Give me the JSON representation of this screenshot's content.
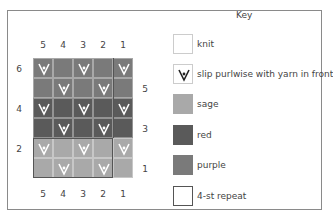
{
  "chart": {
    "column_numbers_top": [
      "5",
      "4",
      "3",
      "2",
      "1"
    ],
    "column_numbers_bottom": [
      "5",
      "4",
      "3",
      "2",
      "1"
    ],
    "row_labels_left": [
      {
        "label": "6",
        "row": 6
      },
      {
        "label": "4",
        "row": 4
      },
      {
        "label": "2",
        "row": 2
      }
    ],
    "row_labels_right": [
      {
        "label": "5",
        "row": 5
      },
      {
        "label": "3",
        "row": 3
      },
      {
        "label": "1",
        "row": 1
      }
    ],
    "rows_top_to_bottom": [
      {
        "row": 6,
        "color": "purple",
        "cells": [
          "slip",
          "knit",
          "slip",
          "knit",
          "slip"
        ]
      },
      {
        "row": 5,
        "color": "purple",
        "cells": [
          "knit",
          "slip",
          "knit",
          "slip",
          "knit"
        ]
      },
      {
        "row": 4,
        "color": "red",
        "cells": [
          "slip",
          "knit",
          "slip",
          "knit",
          "slip"
        ]
      },
      {
        "row": 3,
        "color": "red",
        "cells": [
          "knit",
          "slip",
          "knit",
          "slip",
          "knit"
        ]
      },
      {
        "row": 2,
        "color": "sage",
        "cells": [
          "slip",
          "knit",
          "slip",
          "knit",
          "slip"
        ]
      },
      {
        "row": 1,
        "color": "sage",
        "cells": [
          "knit",
          "slip",
          "knit",
          "slip",
          "knit"
        ]
      }
    ],
    "repeat": {
      "columns": "5-2",
      "label": "4-st repeat"
    }
  },
  "colors": {
    "knit": "#ffffff",
    "sage": "#a9a9a9",
    "red": "#5a5a5a",
    "purple": "#7a7a7a",
    "frame": "#8a8a8a"
  },
  "key": {
    "title": "Key",
    "items": [
      {
        "symbol": "knit",
        "label": "knit"
      },
      {
        "symbol": "slip",
        "label": "slip purlwise with yarn in front"
      },
      {
        "symbol": "sage",
        "label": "sage"
      },
      {
        "symbol": "red",
        "label": "red"
      },
      {
        "symbol": "purple",
        "label": "purple"
      },
      {
        "symbol": "repeat",
        "label": "4-st repeat"
      }
    ]
  }
}
